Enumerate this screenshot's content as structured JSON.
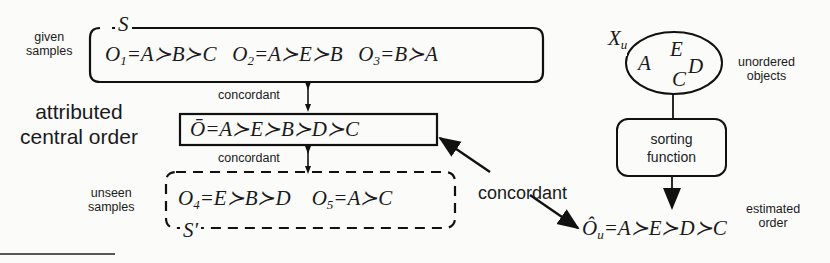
{
  "given_samples": {
    "label_line1": "given",
    "label_line2": "samples",
    "set_symbol": "S",
    "orders": [
      {
        "name": "O",
        "sub": "1",
        "expr": "=A≻B≻C"
      },
      {
        "name": "O",
        "sub": "2",
        "expr": "=A≻E≻B"
      },
      {
        "name": "O",
        "sub": "3",
        "expr": "=B≻A"
      }
    ]
  },
  "central_order": {
    "label_line1": "attributed",
    "label_line2": "central order",
    "expr": "Ō=A≻E≻B≻D≻C"
  },
  "concordant_labels": {
    "upper": "concordant",
    "lower": "concordant",
    "right": "concordant"
  },
  "unseen_samples": {
    "label_line1": "unseen",
    "label_line2": "samples",
    "set_symbol": "S′",
    "orders": [
      {
        "name": "O",
        "sub": "4",
        "expr": "=E≻B≻D"
      },
      {
        "name": "O",
        "sub": "5",
        "expr": "=A≻C"
      }
    ]
  },
  "unordered_objects": {
    "set_symbol": "X",
    "set_sub": "u",
    "label_line1": "unordered",
    "label_line2": "objects",
    "objects": [
      "A",
      "E",
      "D",
      "C"
    ]
  },
  "sorting_function": {
    "label_line1": "sorting",
    "label_line2": "function"
  },
  "estimated_order": {
    "symbol": "Ô",
    "sub": "u",
    "expr": "=A≻E≻D≻C",
    "label_line1": "estimated",
    "label_line2": "order"
  }
}
